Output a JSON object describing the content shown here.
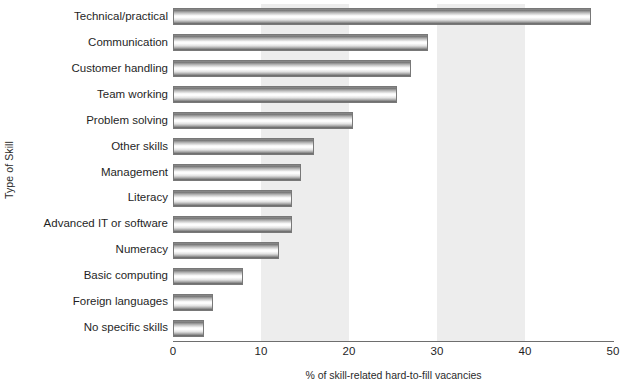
{
  "chart_data": {
    "type": "bar",
    "orientation": "horizontal",
    "title": "",
    "xlabel": "% of skill-related hard-to-fill vacancies",
    "ylabel": "Type of Skill",
    "xlim": [
      0,
      50
    ],
    "xticks": [
      0,
      10,
      20,
      30,
      40,
      50
    ],
    "xtick_labels": [
      "0",
      "10",
      "20",
      "30",
      "40",
      "50"
    ],
    "grid": false,
    "legend": null,
    "shaded_bands": [
      [
        10,
        20
      ],
      [
        30,
        40
      ]
    ],
    "band_color": "#ededed",
    "bar_color": "#c8c8c8",
    "categories": [
      "Technical/practical",
      "Communication",
      "Customer handling",
      "Team working",
      "Problem solving",
      "Other skills",
      "Management",
      "Literacy",
      "Advanced IT or software",
      "Numeracy",
      "Basic computing",
      "Foreign languages",
      "No specific skills"
    ],
    "values": [
      47.5,
      29,
      27,
      25.5,
      20.5,
      16,
      14.5,
      13.5,
      13.5,
      12,
      8,
      4.5,
      3.5
    ]
  }
}
